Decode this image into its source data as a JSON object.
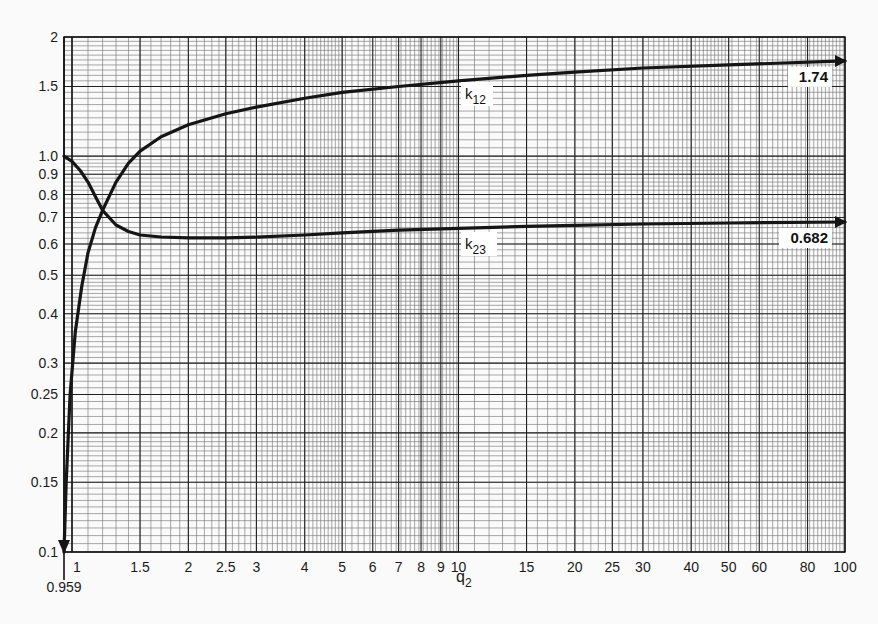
{
  "chart_data": {
    "type": "line",
    "title": "",
    "xlabel": "q2",
    "xlabel_main": "q",
    "xlabel_sub": "2",
    "ylabel": "",
    "xscale": "log",
    "yscale": "log",
    "xlim": [
      0.959,
      100
    ],
    "ylim": [
      0.1,
      2
    ],
    "grid": true,
    "x_ticks": [
      1,
      1.5,
      2,
      2.5,
      3,
      4,
      5,
      6,
      7,
      8,
      9,
      10,
      15,
      20,
      25,
      30,
      40,
      50,
      60,
      80,
      100
    ],
    "x_tick_labels": [
      "1",
      "1.5",
      "2",
      "2.5",
      "3",
      "4",
      "5",
      "6",
      "7",
      "8",
      "9",
      "10",
      "15",
      "20",
      "25",
      "30",
      "40",
      "50",
      "60",
      "80",
      "100"
    ],
    "x_extra_tick": {
      "value": 0.959,
      "label": "0.959"
    },
    "y_ticks": [
      0.1,
      0.15,
      0.2,
      0.25,
      0.3,
      0.4,
      0.5,
      0.6,
      0.7,
      0.8,
      0.9,
      1.0,
      1.5,
      2
    ],
    "y_tick_labels": [
      "0.1",
      "0.15",
      "0.2",
      "0.25",
      "0.3",
      "0.4",
      "0.5",
      "0.6",
      "0.7",
      "0.8",
      "0.9",
      "1.0",
      "1.5",
      "2"
    ],
    "series": [
      {
        "name": "k12",
        "label_main": "k",
        "label_sub": "12",
        "asymptote": 1.74,
        "asymptote_label": "1.74",
        "x": [
          0.959,
          0.97,
          0.99,
          1.02,
          1.06,
          1.1,
          1.15,
          1.2,
          1.3,
          1.4,
          1.5,
          1.7,
          2,
          2.5,
          3,
          4,
          5,
          7,
          10,
          15,
          20,
          30,
          50,
          100
        ],
        "y": [
          0.1,
          0.15,
          0.25,
          0.36,
          0.47,
          0.57,
          0.66,
          0.73,
          0.86,
          0.96,
          1.03,
          1.12,
          1.2,
          1.28,
          1.33,
          1.4,
          1.45,
          1.5,
          1.55,
          1.6,
          1.63,
          1.67,
          1.7,
          1.74
        ]
      },
      {
        "name": "k23",
        "label_main": "k",
        "label_sub": "23",
        "asymptote": 0.682,
        "asymptote_label": "0.682",
        "x": [
          0.959,
          1.0,
          1.05,
          1.1,
          1.15,
          1.2,
          1.3,
          1.4,
          1.5,
          1.7,
          2,
          2.5,
          3,
          4,
          5,
          7,
          10,
          15,
          20,
          30,
          50,
          100
        ],
        "y": [
          1.0,
          0.97,
          0.92,
          0.86,
          0.79,
          0.73,
          0.67,
          0.645,
          0.632,
          0.625,
          0.622,
          0.622,
          0.624,
          0.632,
          0.64,
          0.65,
          0.657,
          0.665,
          0.669,
          0.674,
          0.678,
          0.682
        ]
      }
    ]
  },
  "plot": {
    "left_px": 72,
    "right_px": 845,
    "top_px": 37,
    "bottom_px": 552,
    "axis_origin_px": 64
  },
  "colors": {
    "background": "#fafafa",
    "grid_minor": "#6e6e6e",
    "grid_major": "#222222",
    "curve": "#151515",
    "label_bg": "#ffffff"
  }
}
